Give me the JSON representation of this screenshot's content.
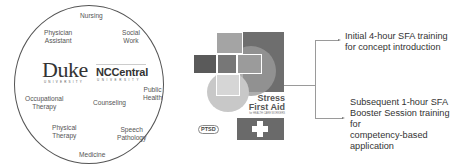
{
  "circle": {
    "disciplines": [
      {
        "label": "Nursing",
        "x": 80,
        "y": 12
      },
      {
        "label": "Physician\nAssistant",
        "x": 40,
        "y": 30
      },
      {
        "label": "Social\nWork",
        "x": 118,
        "y": 28
      },
      {
        "label": "Public\nHealth",
        "x": 142,
        "y": 84
      },
      {
        "label": "Occupational\nTherapy",
        "x": 24,
        "y": 94
      },
      {
        "label": "Counseling",
        "x": 92,
        "y": 99
      },
      {
        "label": "Physical\nTherapy",
        "x": 52,
        "y": 122
      },
      {
        "label": "Speech\nPathology",
        "x": 117,
        "y": 125
      },
      {
        "label": "Medicine",
        "x": 78,
        "y": 150
      }
    ],
    "logos": {
      "duke": "Duke",
      "duke_sub": "UNIVERSITY",
      "nccentral": "NCCentral",
      "nccentral_sub": "UNIVERSITY"
    }
  },
  "cover": {
    "title_line1": "Stress",
    "title_line2": "First Aid",
    "subtitle": "for HEALTH CARE WORKERS",
    "badge": "PTSD"
  },
  "steps": [
    {
      "text_line1": "Initial 4-hour SFA training",
      "text_line2": "for concept introduction"
    },
    {
      "text_line1": "Subsequent 1-hour SFA",
      "text_line2": "Booster Session training for",
      "text_line3": "competency-based",
      "text_line4": "application"
    }
  ],
  "colors": {
    "line": "#9a9a9a",
    "text": "#333333",
    "cover_dark": "#6e6e6e"
  }
}
